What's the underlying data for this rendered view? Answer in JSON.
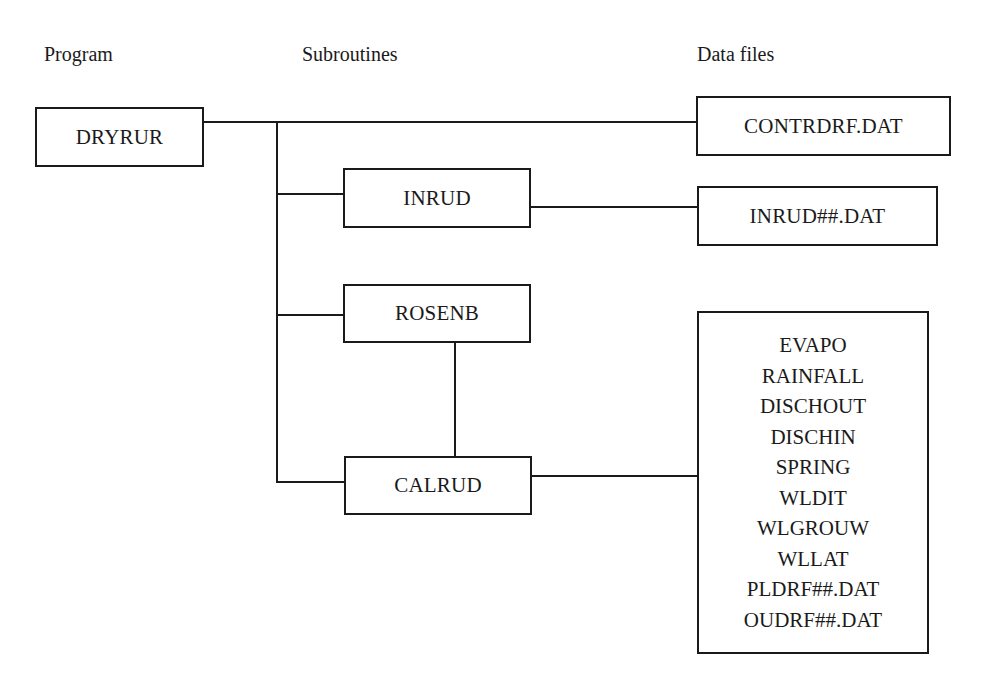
{
  "diagram": {
    "type": "program-structure",
    "columns": {
      "program": "Program",
      "subroutines": "Subroutines",
      "data_files": "Data files"
    },
    "program": {
      "name": "DRYRUR"
    },
    "subroutines": [
      {
        "name": "INRUD"
      },
      {
        "name": "ROSENB"
      },
      {
        "name": "CALRUD"
      }
    ],
    "data_files": {
      "control_file": "CONTRDRF.DAT",
      "inrud_file": "INRUD##.DAT",
      "calrud_files": [
        "EVAPO",
        "RAINFALL",
        "DISCHOUT",
        "DISCHIN",
        "SPRING",
        "WLDIT",
        "WLGROUW",
        "WLLAT",
        "PLDRF##.DAT",
        "OUDRF##.DAT"
      ]
    },
    "connections": [
      {
        "from": "DRYRUR",
        "to": "CONTRDRF.DAT"
      },
      {
        "from": "DRYRUR",
        "to": "INRUD"
      },
      {
        "from": "DRYRUR",
        "to": "ROSENB"
      },
      {
        "from": "DRYRUR",
        "to": "CALRUD"
      },
      {
        "from": "INRUD",
        "to": "INRUD##.DAT"
      },
      {
        "from": "ROSENB",
        "to": "CALRUD"
      },
      {
        "from": "CALRUD",
        "to": "calrud_files"
      }
    ]
  }
}
